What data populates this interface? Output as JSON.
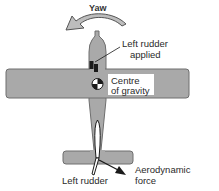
{
  "diagram": {
    "type": "aircraft-top-view",
    "colors": {
      "body_fill": "#a9a9a9",
      "body_stroke": "#6e6e6e",
      "arrow_fill": "#bdbdbd",
      "arrow_stroke": "#555555",
      "ink": "#1a1a1a",
      "label_bg": "#ffffff"
    },
    "labels": {
      "yaw": "Yaw",
      "left_rudder_applied_line1": "Left rudder",
      "left_rudder_applied_line2": "applied",
      "cog_line1": "Centre",
      "cog_line2": "of gravity",
      "left_rudder": "Left rudder",
      "aero_line1": "Aerodynamic",
      "aero_line2": "force"
    },
    "icons": {
      "yaw_arrow": "curved-arrow-left",
      "cog_symbol": "centre-of-gravity-symbol",
      "rudder_pedals": "rudder-pedal-icon",
      "force_arrow": "arrow-down-right"
    }
  }
}
